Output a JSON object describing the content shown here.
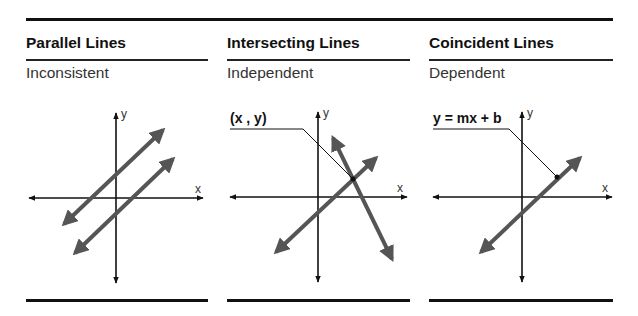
{
  "panels": [
    {
      "title": "Parallel Lines",
      "subtitle": "Inconsistent",
      "x_label": "x",
      "y_label": "y",
      "callout": null
    },
    {
      "title": "Intersecting Lines",
      "subtitle": "Independent",
      "x_label": "x",
      "y_label": "y",
      "callout": "(x , y)"
    },
    {
      "title": "Coincident Lines",
      "subtitle": "Dependent",
      "x_label": "x",
      "y_label": "y",
      "callout": "y = mx + b"
    }
  ],
  "colors": {
    "rule": "#111111",
    "axis": "#111111",
    "line": "#555555",
    "text": "#1a1a1a"
  }
}
